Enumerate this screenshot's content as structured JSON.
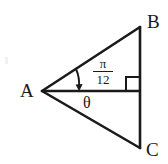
{
  "figure": {
    "type": "geometry-diagram",
    "background_color": "#ffffff",
    "stroke_color": "#1a1a1a",
    "width": 168,
    "height": 164
  },
  "vertices": {
    "A": {
      "label": "A",
      "x": 42,
      "y": 91
    },
    "B": {
      "label": "B",
      "x": 140,
      "y": 27
    },
    "C": {
      "label": "C",
      "x": 140,
      "y": 148
    },
    "D": {
      "label": "",
      "x": 140,
      "y": 91
    }
  },
  "segments": [
    {
      "name": "segment-AB",
      "from": "A",
      "to": "B"
    },
    {
      "name": "segment-AC",
      "from": "A",
      "to": "C"
    },
    {
      "name": "segment-BC",
      "from": "B",
      "to": "C"
    },
    {
      "name": "segment-AD",
      "from": "A",
      "to": "D"
    }
  ],
  "angles": {
    "upper": {
      "name": "angle-pi-over-12",
      "numerator": "π",
      "denominator": "12",
      "value_text": "π/12",
      "between": "AB and AD",
      "marker": "arc-with-arrow"
    },
    "lower": {
      "name": "angle-theta",
      "symbol": "θ",
      "between": "AD and AC"
    },
    "right": {
      "name": "right-angle-mark",
      "at": "D",
      "value_text": "90°",
      "marker": "square"
    }
  }
}
